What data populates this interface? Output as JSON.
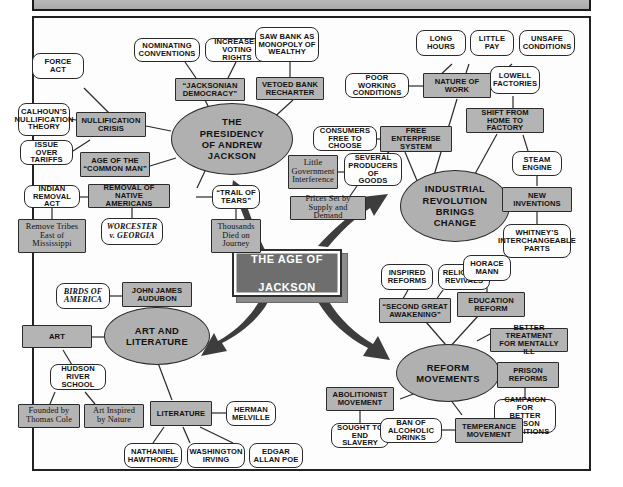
{
  "center": {
    "label": "THE AGE OF\nJACKSON",
    "line1": "THE AGE OF",
    "line2": "JACKSON",
    "fill": "#6e6e6e",
    "text_color": "#ffffff"
  },
  "colors": {
    "shaded_box": "#b4b4b4",
    "ellipse": "#b0b0b0",
    "white_pill": "#fefefe",
    "stroke": "#2a2a2a",
    "arrow": "#3a3a3a",
    "header_bar": "#b0b0b0"
  },
  "branches": [
    {
      "id": "presidency",
      "label": "THE\nPRESIDENCY\nOF ANDREW\nJACKSON"
    },
    {
      "id": "industrial",
      "label": "INDUSTRIAL\nREVOLUTION\nBRINGS\nCHANGE"
    },
    {
      "id": "art",
      "label": "ART AND\nLITERATURE"
    },
    {
      "id": "reform",
      "label": "REFORM\nMOVEMENTS"
    }
  ],
  "nodes": {
    "presidency": "THE PRESIDENCY OF ANDREW JACKSON",
    "jacksonian_democracy": "“JACKSONIAN DEMOCRACY”",
    "nominating_conventions": "NOMINATING CONVENTIONS",
    "increased_voting_rights": "INCREASED VOTING RIGHTS",
    "vetoed_bank_recharter": "VETOED BANK RECHARTER",
    "saw_bank_monopoly": "SAW BANK AS MONOPOLY OF WEALTHY",
    "nullification_crisis": "NULLIFICATION CRISIS",
    "force_act": "FORCE ACT",
    "calhouns_theory": "CALHOUN’S NULLIFICATION THEORY",
    "issue_over_tariffs": "ISSUE OVER TARIFFS",
    "age_common_man": "AGE OF THE “COMMON MAN”",
    "removal_native_americans": "REMOVAL OF NATIVE AMERICANS",
    "indian_removal_act": "INDIAN REMOVAL ACT",
    "remove_tribes": "Remove Tribes East of Mississippi",
    "worcester_georgia": "WORCESTER v. GEORGIA",
    "trail_of_tears": "“TRAIL OF TEARS”",
    "thousands_died": "Thousands Died on Journey",
    "industrial": "INDUSTRIAL REVOLUTION BRINGS CHANGE",
    "nature_of_work": "NATURE OF WORK",
    "long_hours": "LONG HOURS",
    "little_pay": "LITTLE PAY",
    "unsafe_conditions": "UNSAFE CONDITIONS",
    "poor_working_conditions": "POOR WORKING CONDITIONS",
    "free_enterprise": "FREE ENTERPRISE SYSTEM",
    "consumers_free": "CONSUMERS FREE TO CHOOSE",
    "little_gov_interference": "Little Government Interference",
    "several_producers": "SEVERAL PRODUCERS OF GOODS",
    "prices_set": "Prices Set by Supply and Demand",
    "lowell_factories": "LOWELL FACTORIES",
    "shift_home_factory": "SHIFT FROM HOME TO FACTORY",
    "steam_engine": "STEAM ENGINE",
    "new_inventions": "NEW INVENTIONS",
    "whitneys_parts": "WHITNEY’S INTERCHANGEABLE PARTS",
    "art": "ART AND LITERATURE",
    "john_james_audubon": "JOHN JAMES AUDUBON",
    "birds_of_america": "BIRDS OF AMERICA",
    "art_node": "ART",
    "hudson_river_school": "HUDSON RIVER SCHOOL",
    "founded_thomas_cole": "Founded by Thomas Cole",
    "art_inspired_nature": "Art Inspired by Nature",
    "literature": "LITERATURE",
    "herman_melville": "HERMAN MELVILLE",
    "nathaniel_hawthorne": "NATHANIEL HAWTHORNE",
    "washington_irving": "WASHINGTON IRVING",
    "edgar_allan_poe": "EDGAR ALLAN POE",
    "reform": "REFORM MOVEMENTS",
    "second_great_awakening": "“SECOND GREAT AWAKENING”",
    "inspired_reforms": "INSPIRED REFORMS",
    "religious_revivals": "RELIGIOUS REVIVALS",
    "horace_mann": "HORACE MANN",
    "education_reform": "EDUCATION REFORM",
    "better_treatment": "BETTER TREATMENT FOR MENTALLY ILL",
    "prison_reforms": "PRISON REFORMS",
    "campaign_prison": "CAMPAIGN FOR BETTER PRISON CONDITIONS",
    "abolitionist_movement": "ABOLITIONIST MOVEMENT",
    "sought_end_slavery": "SOUGHT TO END SLAVERY",
    "ban_alcoholic_drinks": "BAN OF ALCOHOLIC DRINKS",
    "temperance_movement": "TEMPERANCE MOVEMENT"
  }
}
